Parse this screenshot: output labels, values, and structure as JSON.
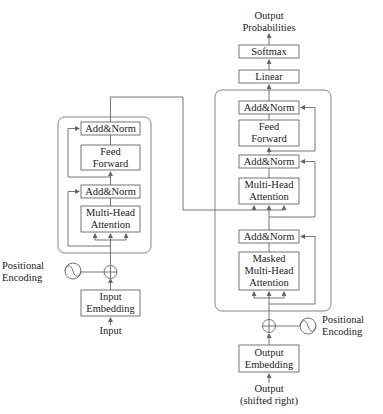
{
  "encoder": {
    "add_norm_top": "Add&Norm",
    "feed_forward": [
      "Feed",
      "Forward"
    ],
    "add_norm_bottom": "Add&Norm",
    "multi_head_attention": [
      "Multi-Head",
      "Attention"
    ],
    "positional_encoding": [
      "Positional",
      "Encoding"
    ],
    "input_embedding": [
      "Input",
      "Embedding"
    ],
    "input_label": "Input"
  },
  "decoder": {
    "output_probabilities": [
      "Output",
      "Probabilities"
    ],
    "softmax": "Softmax",
    "linear": "Linear",
    "add_norm_top": "Add&Norm",
    "feed_forward": [
      "Feed",
      "Forward"
    ],
    "add_norm_mid": "Add&Norm",
    "multi_head_attention": [
      "Multi-Head",
      "Attention"
    ],
    "add_norm_bottom": "Add&Norm",
    "masked_multi_head_attention": [
      "Masked",
      "Multi-Head",
      "Attention"
    ],
    "positional_encoding": [
      "Positional",
      "Encoding"
    ],
    "output_embedding": [
      "Output",
      "Embedding"
    ],
    "output_label": [
      "Output",
      "(shifted right)"
    ]
  },
  "colors": {
    "stroke": "#555555",
    "box_stroke": "#666666",
    "text": "#222222",
    "background": "#ffffff"
  }
}
